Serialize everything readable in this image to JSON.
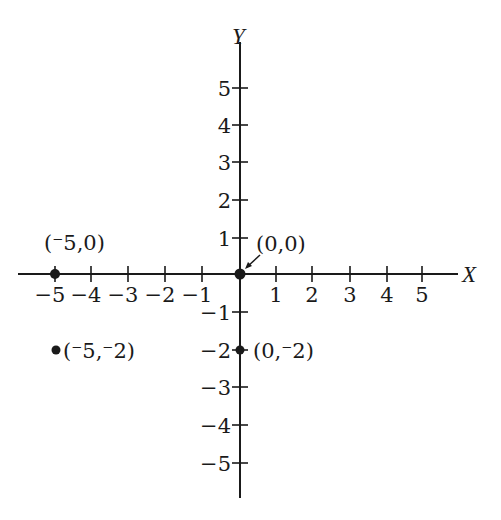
{
  "diagram": {
    "type": "coordinate-plane",
    "x_axis": {
      "name": "X",
      "ticks": [
        -5,
        -4,
        -3,
        -2,
        -1,
        1,
        2,
        3,
        4,
        5
      ],
      "tick_labels": [
        "−5",
        "−4",
        "−3",
        "−2",
        "−1",
        "1",
        "2",
        "3",
        "4",
        "5"
      ]
    },
    "y_axis": {
      "name": "Y",
      "ticks": [
        5,
        4,
        3,
        2,
        1,
        -1,
        -2,
        -3,
        -4,
        -5
      ],
      "tick_labels": [
        "5",
        "4",
        "3",
        "2",
        "1",
        "−1",
        "−2",
        "−3",
        "−4",
        "−5"
      ]
    },
    "points": [
      {
        "x": -5,
        "y": 0,
        "label": "(⁻5,0)"
      },
      {
        "x": 0,
        "y": 0,
        "label": "(0,0)"
      },
      {
        "x": -5,
        "y": -2,
        "label": "(⁻5,⁻2)"
      },
      {
        "x": 0,
        "y": -2,
        "label": "(0,⁻2)"
      }
    ],
    "colors": {
      "ink": "#1a1a1a",
      "background": "#ffffff"
    }
  }
}
